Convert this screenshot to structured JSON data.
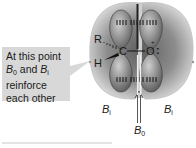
{
  "callout": {
    "lines": [
      {
        "text": "At this point"
      },
      {
        "a": "B",
        "a_sub": "0",
        "mid": " and ",
        "b": "B",
        "b_sub": "i"
      },
      {
        "text": "reinforce"
      },
      {
        "text": "each other"
      }
    ],
    "background": "#d8d8d8"
  },
  "molecule": {
    "atoms": {
      "R": "R",
      "C": "C",
      "H": "H",
      "O": "O"
    },
    "lone_pair_marker": ":",
    "charge_marker": "+"
  },
  "field_labels": {
    "induced_left": {
      "base": "B",
      "sub": "i"
    },
    "induced_right": {
      "base": "B",
      "sub": "i"
    },
    "applied": {
      "base": "B",
      "sub": "0"
    }
  },
  "colors": {
    "field_region": "#8a8a8a",
    "orbital_lobe": "#7a7a7a",
    "text": "#1a1a1a"
  }
}
